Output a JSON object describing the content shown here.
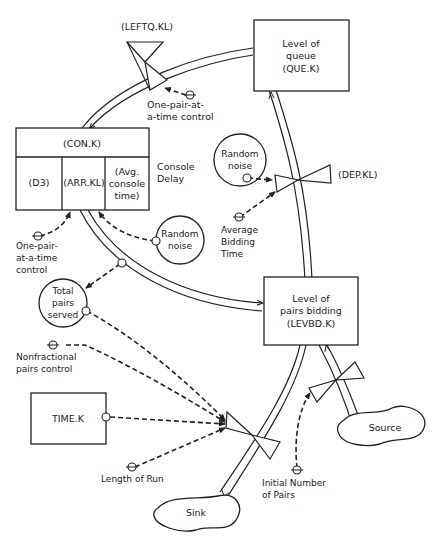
{
  "diagram": {
    "type": "system-dynamics flow diagram",
    "levels": {
      "queue": {
        "line1": "Level of",
        "line2": "queue",
        "line3": "(QUE.K)"
      },
      "bidding": {
        "line1": "Level of",
        "line2": "pairs bidding",
        "line3": "(LEVBD.K)"
      },
      "console": {
        "header": "(CON.K)",
        "cells": [
          "(D3)",
          "(ARR.KL)",
          "(Avg.",
          "console",
          "time)"
        ],
        "side_label_1": "Console",
        "side_label_2": "Delay"
      },
      "time": {
        "label": "TIME.K"
      }
    },
    "rates": {
      "leftq": "(LEFTQ.KL)",
      "dep": "(DEP.KL)"
    },
    "auxiliaries": {
      "random_noise_top": {
        "line1": "Random",
        "line2": "noise"
      },
      "random_noise_mid": {
        "line1": "Random",
        "line2": "noise"
      },
      "total_pairs": {
        "line1": "Total",
        "line2": "pairs",
        "line3": "served"
      }
    },
    "constants": {
      "one_pair_top": {
        "line1": "One-pair-at-",
        "line2": "a-time control"
      },
      "one_pair_left": {
        "line1": "One-pair-",
        "line2": "at-a-time",
        "line3": "control"
      },
      "avg_bidding": {
        "line1": "Average",
        "line2": "Bidding",
        "line3": "Time"
      },
      "nonfractional": {
        "line1": "Nonfractional",
        "line2": "pairs control"
      },
      "length_of_run": {
        "line1": "Length of Run"
      },
      "initial_pairs": {
        "line1": "Initial Number",
        "line2": "of Pairs"
      }
    },
    "clouds": {
      "source": "Source",
      "sink": "Sink"
    }
  }
}
